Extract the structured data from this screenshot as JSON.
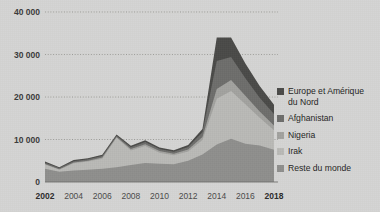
{
  "background_color": "#d5d5d3",
  "chart_data": {
    "type": "area",
    "stacked": true,
    "title": "",
    "subtitle": "",
    "xlabel": "",
    "ylabel": "",
    "grid": true,
    "legend_position": "right",
    "xlim": [
      2002,
      2018
    ],
    "ylim": [
      0,
      40000
    ],
    "x": [
      2002,
      2003,
      2004,
      2005,
      2006,
      2007,
      2008,
      2009,
      2010,
      2011,
      2012,
      2013,
      2014,
      2015,
      2016,
      2017,
      2018
    ],
    "x_tick_labels": [
      "2002",
      "2004",
      "2006",
      "2008",
      "2010",
      "2012",
      "2014",
      "2016",
      "2018"
    ],
    "x_tick_values": [
      2002,
      2004,
      2006,
      2008,
      2010,
      2012,
      2014,
      2016,
      2018
    ],
    "x_tick_bold": [
      true,
      false,
      false,
      false,
      false,
      false,
      false,
      false,
      true
    ],
    "y_tick_labels": [
      "0",
      "10 000",
      "20 000",
      "30 000",
      "40 000"
    ],
    "y_tick_values": [
      0,
      10000,
      20000,
      30000,
      40000
    ],
    "series": [
      {
        "name": "Reste du monde",
        "color": "#8f8f8d",
        "values": [
          3100,
          2400,
          2700,
          2900,
          3100,
          3500,
          4000,
          4500,
          4300,
          4200,
          5000,
          6500,
          8800,
          10200,
          9000,
          8600,
          7600
        ]
      },
      {
        "name": "Irak",
        "color": "#b9b9b6",
        "values": [
          1000,
          500,
          1700,
          1900,
          2400,
          6900,
          3400,
          4000,
          2600,
          2100,
          2200,
          3400,
          10800,
          11200,
          9300,
          6500,
          4600
        ]
      },
      {
        "name": "Nigeria",
        "color": "#a2a29f",
        "values": [
          150,
          120,
          200,
          220,
          250,
          200,
          350,
          400,
          380,
          350,
          450,
          700,
          2300,
          2600,
          2000,
          1500,
          1100
        ]
      },
      {
        "name": "Afghanistan",
        "color": "#6d6d6b",
        "values": [
          300,
          250,
          300,
          320,
          350,
          300,
          450,
          500,
          480,
          450,
          600,
          1100,
          6600,
          5400,
          4100,
          3200,
          2700
        ]
      },
      {
        "name": "Europe et Amérique du Nord",
        "color": "#4a4a48",
        "values": [
          250,
          200,
          250,
          260,
          300,
          250,
          350,
          400,
          380,
          350,
          450,
          800,
          5500,
          4600,
          3500,
          2800,
          2200
        ]
      }
    ],
    "legend_entries": [
      {
        "label": "Europe et Amérique\ndu Nord",
        "color": "#4a4a48"
      },
      {
        "label": "Afghanistan",
        "color": "#6d6d6b"
      },
      {
        "label": "Nigeria",
        "color": "#a2a29f"
      },
      {
        "label": "Irak",
        "color": "#b9b9b6"
      },
      {
        "label": "Reste du monde",
        "color": "#8f8f8d"
      }
    ]
  }
}
